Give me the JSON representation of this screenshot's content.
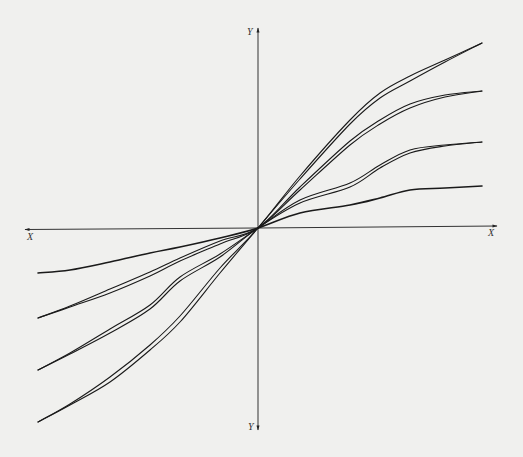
{
  "chart_data": {
    "type": "line",
    "title": "",
    "axes": {
      "x_label_left": "X",
      "x_label_right": "X",
      "y_label_top": "Y",
      "y_label_bottom": "Y",
      "origin_px": [
        258,
        228
      ],
      "x_axis_px": {
        "from": [
          25,
          229.5
        ],
        "to": [
          497,
          226
        ]
      },
      "y_axis_px": {
        "from": [
          258,
          430
        ],
        "to": [
          258,
          28
        ]
      },
      "grid": false,
      "ticks": false
    },
    "series": [
      {
        "name": "curve-1-steepest",
        "lines": [
          [
            [
              38,
              422
            ],
            [
              70,
              404
            ],
            [
              110,
              377
            ],
            [
              150,
              345
            ],
            [
              180,
              316
            ],
            [
              220,
              268
            ],
            [
              258,
              228
            ],
            [
              300,
              176
            ],
            [
              350,
              120
            ],
            [
              380,
              93
            ],
            [
              410,
              76
            ],
            [
              445,
              60
            ],
            [
              482,
              43
            ]
          ],
          [
            [
              38,
              422
            ],
            [
              70,
              405
            ],
            [
              110,
              382
            ],
            [
              150,
              350
            ],
            [
              180,
              322
            ],
            [
              220,
              273
            ],
            [
              258,
              228
            ],
            [
              300,
              179
            ],
            [
              350,
              124
            ],
            [
              380,
              98
            ],
            [
              410,
              81
            ],
            [
              445,
              62
            ],
            [
              482,
              43
            ]
          ]
        ]
      },
      {
        "name": "curve-2",
        "lines": [
          [
            [
              38,
              318
            ],
            [
              70,
              306
            ],
            [
              110,
              289
            ],
            [
              150,
              272
            ],
            [
              180,
              258
            ],
            [
              220,
              241
            ],
            [
              258,
              228
            ],
            [
              300,
              187
            ],
            [
              350,
              141
            ],
            [
              380,
              120
            ],
            [
              410,
              104
            ],
            [
              445,
              95
            ],
            [
              482,
              91
            ]
          ],
          [
            [
              38,
              318
            ],
            [
              70,
              307
            ],
            [
              110,
              293
            ],
            [
              150,
              276
            ],
            [
              180,
              261
            ],
            [
              220,
              244
            ],
            [
              258,
              228
            ],
            [
              300,
              190
            ],
            [
              350,
              145
            ],
            [
              380,
              124
            ],
            [
              410,
              108
            ],
            [
              445,
              97
            ],
            [
              482,
              91
            ]
          ]
        ]
      },
      {
        "name": "curve-3",
        "lines": [
          [
            [
              38,
              370
            ],
            [
              70,
              353
            ],
            [
              110,
              329
            ],
            [
              150,
              305
            ],
            [
              180,
              277
            ],
            [
              220,
              254
            ],
            [
              258,
              228
            ],
            [
              300,
              200
            ],
            [
              350,
              183
            ],
            [
              380,
              165
            ],
            [
              410,
              150
            ],
            [
              445,
              145
            ],
            [
              482,
              142
            ]
          ],
          [
            [
              38,
              370
            ],
            [
              70,
              354
            ],
            [
              110,
              333
            ],
            [
              150,
              309
            ],
            [
              180,
              281
            ],
            [
              220,
              257
            ],
            [
              258,
              228
            ],
            [
              300,
              203
            ],
            [
              350,
              187
            ],
            [
              380,
              168
            ],
            [
              410,
              153
            ],
            [
              445,
              146
            ],
            [
              482,
              142
            ]
          ]
        ]
      },
      {
        "name": "curve-4-flattest",
        "lines": [
          [
            [
              38,
              273
            ],
            [
              70,
              270
            ],
            [
              110,
              262
            ],
            [
              150,
              253
            ],
            [
              180,
              247
            ],
            [
              220,
              238
            ],
            [
              258,
              228
            ],
            [
              300,
              213
            ],
            [
              350,
              205
            ],
            [
              380,
              198
            ],
            [
              410,
              190
            ],
            [
              445,
              188
            ],
            [
              482,
              186
            ]
          ]
        ]
      }
    ],
    "colors": {
      "background": "#f0f0ee",
      "line": "#1a1a1a",
      "axis": "#333333"
    }
  }
}
